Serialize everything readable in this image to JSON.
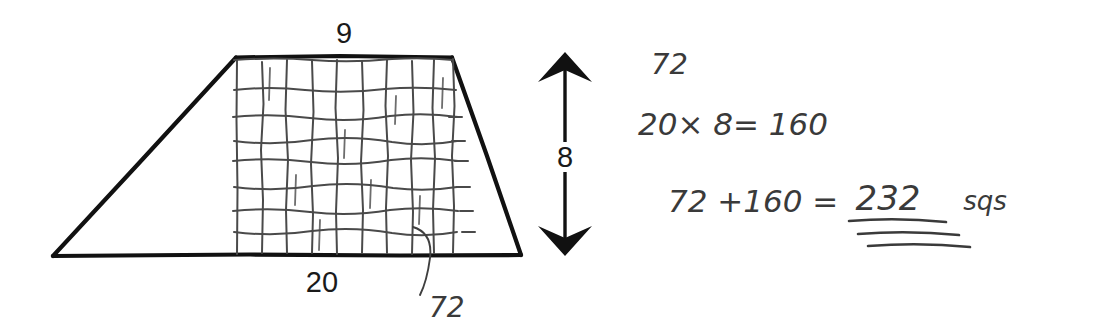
{
  "document": {
    "title": "Trapezoid area hand-worked solution",
    "background_color": "#ffffff",
    "ink_color": "#111111",
    "pencil_color": "#3f3f3f"
  },
  "figure": {
    "name": "trapezoid-with-grid",
    "shape": "trapezoid",
    "top_label": "9",
    "bottom_label": "20",
    "height_label": "8",
    "grid_count_label": "72",
    "grid_columns": 9,
    "grid_rows": 8,
    "vertices": {
      "bottom_left": [
        53,
        256
      ],
      "top_left": [
        236,
        57
      ],
      "top_right": [
        452,
        57
      ],
      "bottom_right": [
        521,
        256
      ]
    }
  },
  "height_arrow": {
    "name": "height-double-arrow",
    "label": "8",
    "orientation": "vertical",
    "top": [
      565,
      55
    ],
    "bottom": [
      565,
      255
    ]
  },
  "work": {
    "lines": [
      {
        "id": "triangle-area",
        "text": "72"
      },
      {
        "id": "rectangle-area",
        "text": "20× 8=  160"
      },
      {
        "id": "total-area",
        "text": "72 +160  ="
      }
    ],
    "answer": "232",
    "answer_units": "sqs",
    "answer_underline_count": 3
  },
  "annotation": {
    "name": "grid-count-callout",
    "label": "72"
  }
}
